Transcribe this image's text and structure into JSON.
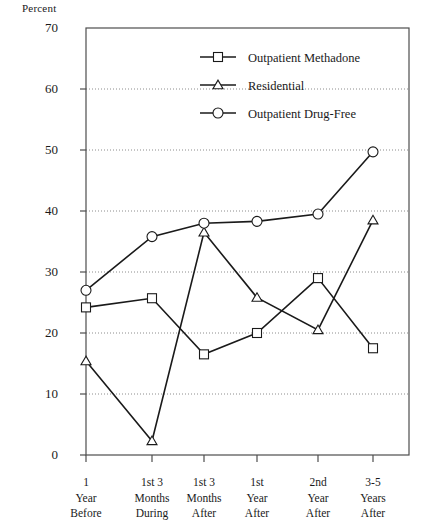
{
  "chart_data": {
    "type": "line",
    "title": "",
    "ylabel": "Percent",
    "xlabel": "",
    "ylim": [
      0,
      70
    ],
    "yticks": [
      0,
      10,
      20,
      30,
      40,
      50,
      60,
      70
    ],
    "grid": true,
    "legend_position": "top-center",
    "categories": [
      "1 Year Before",
      "1st 3 Months During",
      "1st 3 Months After",
      "1st Year After",
      "2nd Year After",
      "3-5 Years After"
    ],
    "category_lines": [
      [
        "1",
        "Year",
        "Before"
      ],
      [
        "1st 3",
        "Months",
        "During"
      ],
      [
        "1st 3",
        "Months",
        "After"
      ],
      [
        "1st",
        "Year",
        "After"
      ],
      [
        "2nd",
        "Year",
        "After"
      ],
      [
        "3-5",
        "Years",
        "After"
      ]
    ],
    "series": [
      {
        "name": "Outpatient Methadone",
        "marker": "square",
        "values": [
          24.2,
          25.7,
          16.5,
          20.0,
          29.0,
          17.5
        ]
      },
      {
        "name": "Residential",
        "marker": "triangle",
        "values": [
          15.4,
          2.3,
          36.5,
          25.8,
          20.5,
          38.5
        ]
      },
      {
        "name": "Outpatient Drug-Free",
        "marker": "circle",
        "values": [
          27.0,
          35.8,
          38.0,
          38.3,
          39.5,
          49.7
        ]
      }
    ],
    "ytick_labels": [
      "0",
      "10",
      "20",
      "30",
      "40",
      "50",
      "60",
      "70"
    ],
    "colors": {
      "line": "#1a1a1a",
      "grid": "#8c8c8c",
      "axis": "#4d4d4d",
      "background": "#ffffff"
    }
  }
}
